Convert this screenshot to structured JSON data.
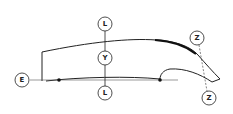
{
  "diagram": {
    "type": "technical-profile-diagram",
    "colors": {
      "stroke": "#222222",
      "background": "#ffffff",
      "label_fill": "#ffffff"
    },
    "labels": {
      "top_l": "L",
      "middle_y": "Y",
      "bottom_l": "L",
      "left_e": "E",
      "top_z": "Z",
      "bottom_z": "Z"
    }
  }
}
